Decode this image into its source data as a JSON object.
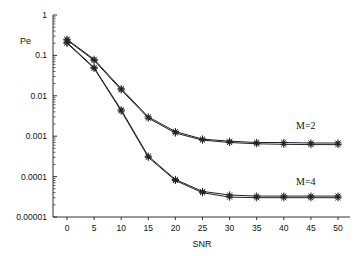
{
  "chart_data": {
    "type": "line",
    "title": "",
    "xlabel": "SNR",
    "ylabel": "Pe",
    "yscale": "log",
    "ylim": [
      1e-05,
      1
    ],
    "xlim": [
      0,
      50
    ],
    "grid": false,
    "legend": "inline annotations",
    "x": [
      0,
      5,
      10,
      15,
      20,
      25,
      30,
      35,
      40,
      45,
      50
    ],
    "x_tick_labels": [
      "0",
      "5",
      "10",
      "15",
      "20",
      "25",
      "30",
      "35",
      "40",
      "45",
      "50"
    ],
    "y_tick_labels": [
      "1",
      "0.1",
      "0.01",
      "0.001",
      "0.0001",
      "0.00001"
    ],
    "y_tick_values": [
      1,
      0.1,
      0.01,
      0.001,
      0.0001,
      1e-05
    ],
    "series": [
      {
        "name": "M=2 (a)",
        "group": "M=2",
        "values": [
          0.25,
          0.08,
          0.015,
          0.003,
          0.0013,
          0.00085,
          0.00075,
          0.0007,
          0.0007,
          0.00068,
          0.00068
        ]
      },
      {
        "name": "M=2 (b)",
        "group": "M=2",
        "values": [
          0.24,
          0.075,
          0.014,
          0.0028,
          0.0012,
          0.0008,
          0.0007,
          0.00065,
          0.00063,
          0.00062,
          0.00062
        ]
      },
      {
        "name": "M=4 (a)",
        "group": "M=4",
        "values": [
          0.21,
          0.05,
          0.0045,
          0.00032,
          8.5e-05,
          4.3e-05,
          3.5e-05,
          3.3e-05,
          3.3e-05,
          3.3e-05,
          3.3e-05
        ]
      },
      {
        "name": "M=4 (b)",
        "group": "M=4",
        "values": [
          0.2,
          0.048,
          0.0042,
          0.0003,
          8e-05,
          4e-05,
          3.1e-05,
          3e-05,
          3e-05,
          3e-05,
          3e-05
        ]
      }
    ],
    "annotations": [
      {
        "text": "M=2",
        "x": 45,
        "y": 0.0015
      },
      {
        "text": "M=4",
        "x": 45,
        "y": 7.5e-05
      }
    ],
    "marker": "asterisk",
    "line_color": "#222222"
  }
}
